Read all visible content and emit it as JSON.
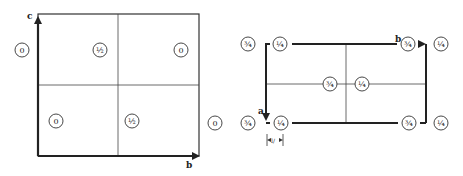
{
  "left_diagram": {
    "axis_vertical_label": "c",
    "axis_horizontal_label": "b",
    "atoms": [
      {
        "label": "0",
        "x": 22,
        "y": 50
      },
      {
        "label": "½",
        "x": 100,
        "y": 50
      },
      {
        "label": "0",
        "x": 181,
        "y": 50
      },
      {
        "label": "0",
        "x": 56,
        "y": 121
      },
      {
        "label": "½",
        "x": 132,
        "y": 121
      },
      {
        "label": "0",
        "x": 215,
        "y": 123
      }
    ]
  },
  "right_diagram": {
    "axis_vertical_label": "a",
    "axis_horizontal_label": "b",
    "dimension_label": "l/",
    "atoms": [
      {
        "label": "¾",
        "x": 248,
        "y": 44
      },
      {
        "label": "¼",
        "x": 280,
        "y": 44
      },
      {
        "label": "¾",
        "x": 408,
        "y": 44
      },
      {
        "label": "¼",
        "x": 441,
        "y": 44
      },
      {
        "label": "¾",
        "x": 330,
        "y": 84
      },
      {
        "label": "¼",
        "x": 362,
        "y": 84
      },
      {
        "label": "¾",
        "x": 248,
        "y": 123
      },
      {
        "label": "¼",
        "x": 281,
        "y": 123
      },
      {
        "label": "¾",
        "x": 409,
        "y": 123
      },
      {
        "label": "¼",
        "x": 441,
        "y": 123
      }
    ]
  }
}
